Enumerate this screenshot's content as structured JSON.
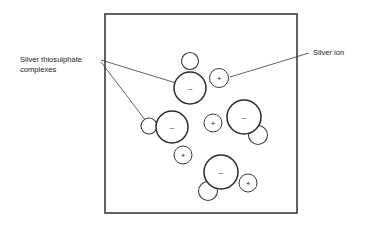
{
  "figure": {
    "type": "diagram",
    "background_color": "#ffffff",
    "line_color": "#3a3a3a",
    "container": {
      "name": "solution-box",
      "x": 105,
      "y": 14,
      "width": 192,
      "height": 199
    },
    "labels": [
      {
        "id": "complexes",
        "lines": [
          "Silver thiosulphate",
          "complexes"
        ],
        "text_x": 20,
        "line1_y": 62,
        "line2_y": 72,
        "anchor": "start",
        "leaders": [
          {
            "x1": 101,
            "y1": 60,
            "x2": 176,
            "y2": 83
          },
          {
            "x1": 101,
            "y1": 62,
            "x2": 146,
            "y2": 121
          }
        ]
      },
      {
        "id": "silver-ion",
        "lines": [
          "Silver ion"
        ],
        "text_x": 313,
        "line1_y": 55,
        "anchor": "start",
        "leaders": [
          {
            "x1": 309,
            "y1": 53,
            "x2": 230,
            "y2": 77
          }
        ]
      }
    ],
    "complexes": [
      {
        "id": "complex-top",
        "sign": "–",
        "main": {
          "cx": 190,
          "cy": 88,
          "r": 16
        },
        "sub": {
          "cx": 190,
          "cy": 61,
          "r": 8.5
        }
      },
      {
        "id": "complex-left",
        "sign": "–",
        "main": {
          "cx": 172,
          "cy": 127,
          "r": 16
        },
        "sub": {
          "cx": 149,
          "cy": 126,
          "r": 8
        }
      },
      {
        "id": "complex-right",
        "sign": "–",
        "main": {
          "cx": 244,
          "cy": 117,
          "r": 17
        },
        "sub": {
          "cx": 258,
          "cy": 135,
          "r": 9.5
        }
      },
      {
        "id": "complex-bottom",
        "sign": "–",
        "main": {
          "cx": 221,
          "cy": 172,
          "r": 17
        },
        "sub": {
          "cx": 208,
          "cy": 191,
          "r": 9.5
        }
      }
    ],
    "ions": [
      {
        "id": "ion-top-right",
        "sign": "+",
        "cx": 219,
        "cy": 78,
        "r": 9.5
      },
      {
        "id": "ion-middle",
        "sign": "+",
        "cx": 213,
        "cy": 123,
        "r": 9
      },
      {
        "id": "ion-lower-left",
        "sign": "+",
        "cx": 183,
        "cy": 155,
        "r": 9
      },
      {
        "id": "ion-bottom-right",
        "sign": "+",
        "cx": 248,
        "cy": 183,
        "r": 9
      }
    ]
  }
}
